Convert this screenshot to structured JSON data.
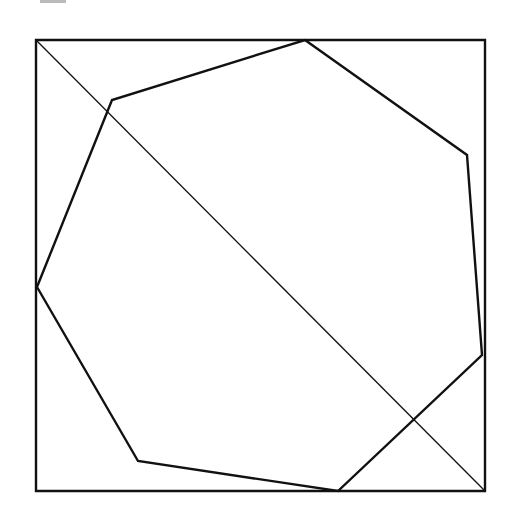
{
  "diagram": {
    "type": "geometry-figure",
    "stroke_color": "#111111",
    "background": "#ffffff",
    "square": {
      "corners": [
        [
          36,
          40
        ],
        [
          485,
          40
        ],
        [
          485,
          491
        ],
        [
          36,
          491
        ]
      ],
      "stroke_width": 2.4
    },
    "diagonal": {
      "from": [
        36,
        40
      ],
      "to": [
        485,
        491
      ],
      "stroke_width": 1.3
    },
    "heptagon": {
      "vertices": [
        [
          305,
          40
        ],
        [
          467,
          155
        ],
        [
          482,
          355
        ],
        [
          338,
          491
        ],
        [
          138,
          461
        ],
        [
          37,
          287
        ],
        [
          112,
          100
        ]
      ],
      "stroke_width": 2.4
    }
  }
}
